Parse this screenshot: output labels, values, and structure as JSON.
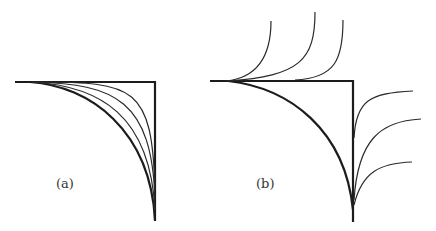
{
  "panels": [
    {
      "id": "a",
      "label": "(a)",
      "description": "Family of convex curves interpolating between a quarter-circle-like arc and the right-angle corner",
      "corner": [
        155,
        82
      ],
      "curve_count": 4
    },
    {
      "id": "b",
      "label": "(b)",
      "description": "Thick arc and right-angle corner with branching curves emanating upward from the top edge and rightward from the vertical edge",
      "corner": [
        353,
        81
      ],
      "upper_branch_count": 3,
      "right_branch_count": 3
    }
  ],
  "colors": {
    "stroke": "#1c1c1c",
    "background": "#ffffff"
  }
}
